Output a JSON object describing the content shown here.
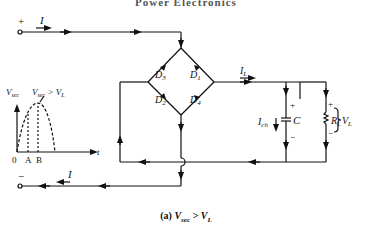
{
  "header": {
    "title": "Power Electronics"
  },
  "circuit": {
    "input_plus": "+",
    "input_minus": "−",
    "current_in": "I",
    "current_out": "I",
    "diodes": [
      "D3",
      "D1",
      "D2",
      "D4"
    ],
    "load_current": "IL",
    "cap_current": "Ich",
    "capacitor": "C",
    "resistor": "RL",
    "load_voltage": "VL",
    "cap_plus": "+",
    "cap_minus": "−",
    "res_plus": "+",
    "res_minus": "−"
  },
  "inset": {
    "y_label": "Vsec",
    "curve_label": "Vsec > VL",
    "x_label": "t",
    "ticks": [
      "0",
      "A",
      "B"
    ]
  },
  "caption": {
    "prefix": "(a)",
    "condition": "Vsec > VL"
  }
}
